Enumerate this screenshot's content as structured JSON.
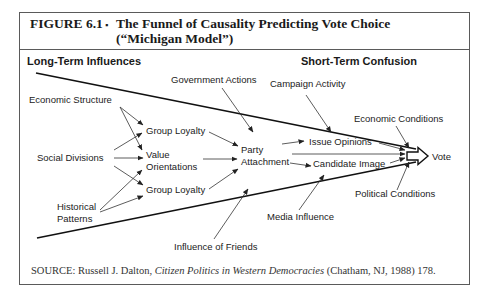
{
  "figure": {
    "label": "FIGURE 6.1",
    "bullet": "▪",
    "title_line1": "The Funnel of Causality Predicting Vote Choice",
    "title_line2": "(“Michigan Model”)"
  },
  "headings": {
    "left": "Long-Term Influences",
    "right": "Short-Term Confusion"
  },
  "nodes": {
    "economic_structure": "Economic Structure",
    "social_divisions": "Social Divisions",
    "historical_patterns_1": "Historical",
    "historical_patterns_2": "Patterns",
    "group_loyalty_top": "Group Loyalty",
    "value_orientations_1": "Value",
    "value_orientations_2": "Orientations",
    "group_loyalty_bottom": "Group Loyalty",
    "government_actions": "Government Actions",
    "party_attachment_1": "Party",
    "party_attachment_2": "Attachment",
    "campaign_activity": "Campaign Activity",
    "issue_opinions": "Issue Opinions",
    "candidate_image": "Candidate Image",
    "economic_conditions": "Economic Conditions",
    "political_conditions": "Political Conditions",
    "media_influence": "Media Influence",
    "influence_of_friends": "Influence of Friends",
    "vote": "Vote"
  },
  "source": {
    "prefix": "SOURCE:  Russell J. Dalton,  ",
    "book": "Citizen Politics in Western Democracies",
    "suffix": " (Chatham, NJ, 1988) 178."
  },
  "colors": {
    "frame": "#5a5a5a",
    "ink": "#1a1a1a",
    "background": "#ffffff"
  }
}
